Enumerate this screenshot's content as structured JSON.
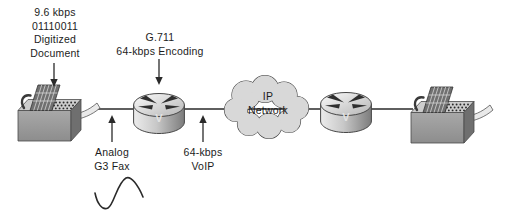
{
  "canvas": {
    "width": 509,
    "height": 217,
    "background": "#ffffff"
  },
  "colors": {
    "text": "#1c1c1c",
    "connection_line": "#2a2a2a",
    "cloud_fill": "#d8d8d8",
    "cloud_stroke": "#3c3c3c",
    "fax_body_gray": "#9c9c9c",
    "router_badge_text": "#e2e2e2"
  },
  "icons": {
    "left_fax": "fax-machine-icon",
    "left_router": "voice-router-icon",
    "cloud": "network-cloud-icon",
    "right_router": "voice-router-icon",
    "right_fax": "fax-machine-icon",
    "waveform": "sine-wave-icon"
  },
  "annotations": {
    "digitized_document": {
      "line1": "9.6 kbps",
      "line2": "01110011",
      "line3": "Digitized",
      "line4": "Document"
    },
    "encoding": {
      "line1": "G.711",
      "line2": "64-kbps Encoding"
    },
    "analog_fax": {
      "line1": "Analog",
      "line2": "G3 Fax"
    },
    "voip": {
      "line1": "64-kbps",
      "line2": "VoIP"
    }
  },
  "nodes": {
    "cloud": {
      "line1": "IP",
      "line2": "Network"
    },
    "left_router": {
      "badge": "V"
    },
    "right_router": {
      "badge": "V"
    }
  }
}
